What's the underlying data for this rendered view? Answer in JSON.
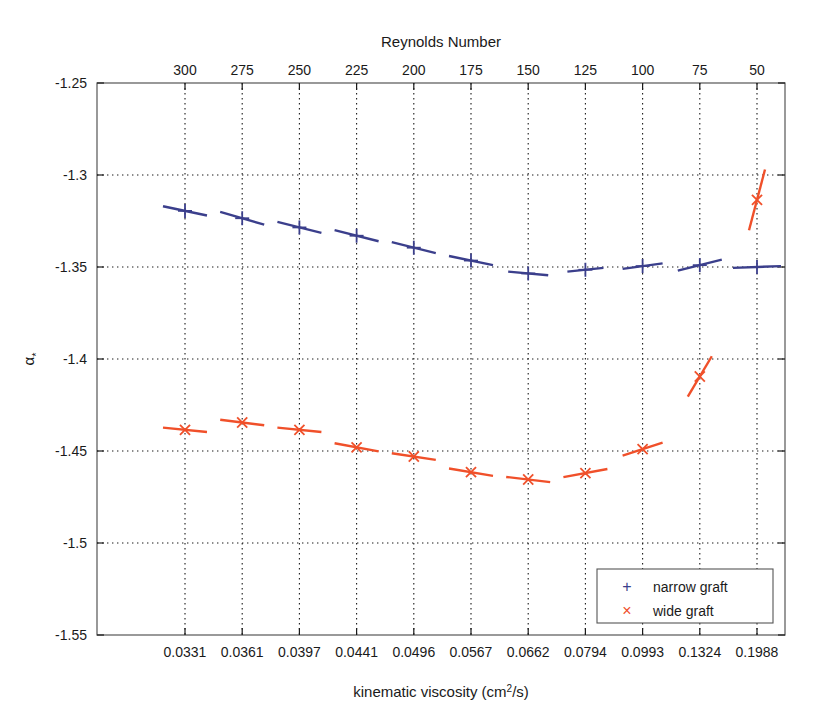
{
  "chart_data": {
    "type": "scatter",
    "title": "",
    "top_axis_label": "Reynolds Number",
    "xlabel_parts": {
      "pre": "kinematic viscosity (cm",
      "sup": "2",
      "post": "/s)"
    },
    "xlabel": "kinematic viscosity (cm2/s)",
    "ylabel": "α",
    "ylabel_sub": "*",
    "grid": true,
    "legend_position": "lower right",
    "ylim": [
      -1.55,
      -1.25
    ],
    "yticks": [
      "-1.25",
      "-1.3",
      "-1.35",
      "-1.4",
      "-1.45",
      "-1.5",
      "-1.55"
    ],
    "ytick_values": [
      -1.25,
      -1.3,
      -1.35,
      -1.4,
      -1.45,
      -1.5,
      -1.55
    ],
    "xtick_labels": [
      "0.0331",
      "0.0361",
      "0.0397",
      "0.0441",
      "0.0496",
      "0.0567",
      "0.0662",
      "0.0794",
      "0.0993",
      "0.1324",
      "0.1988"
    ],
    "top_tick_labels": [
      "300",
      "275",
      "250",
      "225",
      "200",
      "175",
      "150",
      "125",
      "100",
      "75",
      "50"
    ],
    "categories": [
      0.0331,
      0.0361,
      0.0397,
      0.0441,
      0.0496,
      0.0567,
      0.0662,
      0.0794,
      0.0993,
      0.1324,
      0.1988
    ],
    "series": [
      {
        "name": "narrow graft",
        "marker": "+",
        "color": "#3b3f8c",
        "values": [
          -1.3195,
          -1.3235,
          -1.3285,
          -1.333,
          -1.3395,
          -1.3465,
          -1.3535,
          -1.3515,
          -1.3495,
          -1.349,
          -1.35
        ],
        "slopes": [
          -0.0025,
          -0.0035,
          -0.003,
          -0.003,
          -0.003,
          -0.0025,
          -0.001,
          0.001,
          0.0015,
          0.003,
          0.0005
        ],
        "halfwidths": [
          22,
          22,
          22,
          22,
          22,
          22,
          20,
          18,
          20,
          22,
          24
        ]
      },
      {
        "name": "wide graft",
        "marker": "x",
        "color": "#f0502a",
        "values": [
          -1.4385,
          -1.4345,
          -1.4385,
          -1.448,
          -1.453,
          -1.4615,
          -1.4655,
          -1.462,
          -1.449,
          -1.4095,
          -1.3135
        ],
        "slopes": [
          -0.0012,
          -0.0015,
          -0.0012,
          -0.0022,
          -0.0018,
          -0.002,
          -0.0014,
          0.0022,
          0.0035,
          0.011,
          0.0165
        ],
        "halfwidths": [
          22,
          22,
          22,
          22,
          22,
          22,
          22,
          22,
          20,
          12,
          8
        ]
      }
    ]
  },
  "legend": {
    "entries": [
      {
        "marker": "+",
        "label": "narrow graft",
        "color": "#3b3f8c"
      },
      {
        "marker": "×",
        "label": "wide graft",
        "color": "#f0502a"
      }
    ]
  }
}
